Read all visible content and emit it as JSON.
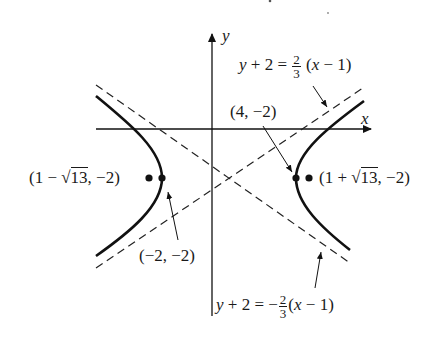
{
  "figure": {
    "type": "hyperbola",
    "center": "(1, -2)",
    "axes": {
      "x_label": "x",
      "y_label": "y"
    },
    "asymptotes": [
      {
        "id": "asymptote-positive",
        "lhs": "y + 2 = ",
        "coef_num": "2",
        "coef_den": "3",
        "sign": "",
        "rhs": "(x − 1)"
      },
      {
        "id": "asymptote-negative",
        "lhs": "y + 2 = ",
        "coef_num": "2",
        "coef_den": "3",
        "sign": "−",
        "rhs": "(x − 1)"
      }
    ],
    "vertices": [
      {
        "label": "(−2, −2)"
      },
      {
        "label": "(4, −2)"
      }
    ],
    "foci": [
      {
        "prefix": "(1 − √",
        "radicand": "13",
        "suffix": ", −2)"
      },
      {
        "prefix": "(1 + √",
        "radicand": "13",
        "suffix": ", −2)"
      }
    ]
  },
  "colors": {
    "stroke": "#111111",
    "background": "#ffffff"
  }
}
